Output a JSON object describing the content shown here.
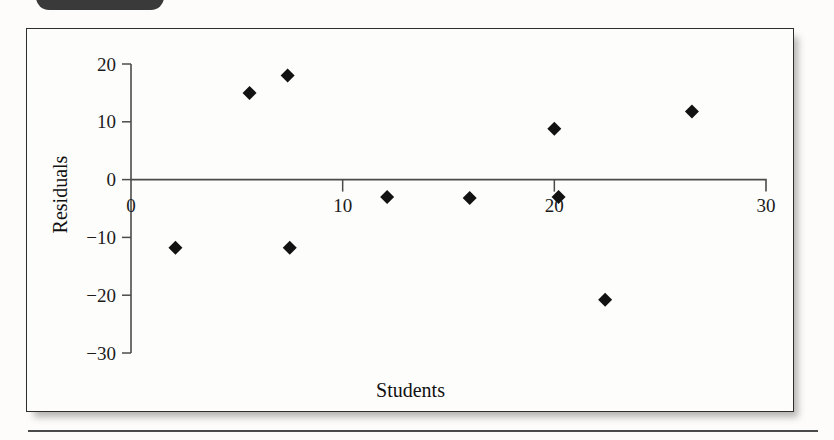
{
  "figure": {
    "tab_label": "",
    "caption": ""
  },
  "chart_data": {
    "type": "scatter",
    "title": "",
    "xlabel": "Students",
    "ylabel": "Residuals",
    "xlim": [
      0,
      30
    ],
    "ylim": [
      -30,
      20
    ],
    "grid": false,
    "legend": null,
    "x_ticks": [
      0,
      10,
      20,
      30
    ],
    "x_tick_labels": [
      "0",
      "10",
      "20",
      "30"
    ],
    "y_ticks": [
      20,
      10,
      0,
      -10,
      -20,
      -30
    ],
    "y_tick_labels": [
      "20",
      "10",
      "0",
      "−10",
      "−20",
      "−30"
    ],
    "zero_line": 0,
    "marker": "diamond",
    "marker_color": "#121212",
    "points": [
      {
        "x": 2.1,
        "y": -11.8
      },
      {
        "x": 5.6,
        "y": 15.0
      },
      {
        "x": 7.4,
        "y": 18.0
      },
      {
        "x": 7.5,
        "y": -11.8
      },
      {
        "x": 12.1,
        "y": -3.0
      },
      {
        "x": 16.0,
        "y": -3.2
      },
      {
        "x": 20.0,
        "y": 8.8
      },
      {
        "x": 20.2,
        "y": -3.0
      },
      {
        "x": 22.4,
        "y": -20.8
      },
      {
        "x": 26.5,
        "y": 11.8
      }
    ]
  }
}
